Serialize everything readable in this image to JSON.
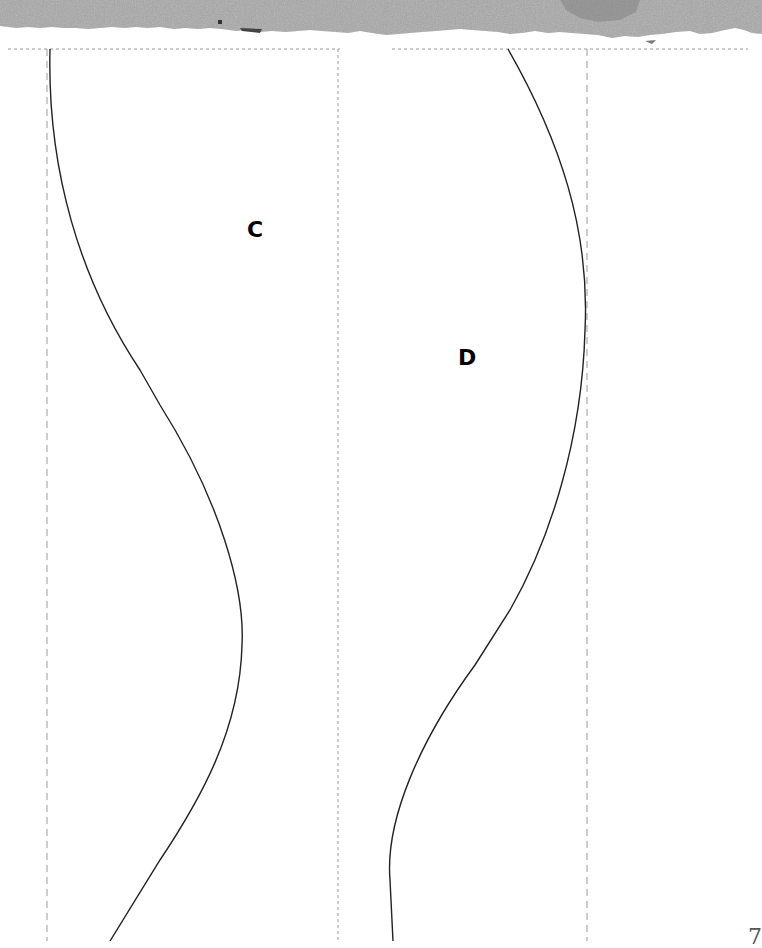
{
  "page": {
    "type": "sewing-pattern-sheet",
    "background": "#ffffff"
  },
  "header": {
    "torn_strip_color": "#a9a9a9",
    "torn_strip_shadow": "#8a8a8a"
  },
  "guides": {
    "dash_color": "#9a9a9a",
    "top_line_y": 49,
    "vertical_lines_x": [
      47,
      338,
      587
    ]
  },
  "pieces": [
    {
      "id": "C",
      "label": "C",
      "label_pos": [
        247,
        219
      ]
    },
    {
      "id": "D",
      "label": "D",
      "label_pos": [
        458,
        347
      ]
    }
  ],
  "footer": {
    "page_number": "7"
  }
}
